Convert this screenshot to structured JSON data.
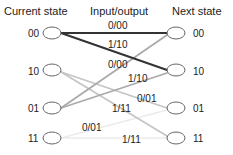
{
  "headers": {
    "current": "Current state",
    "io": "Input/output",
    "next": "Next state"
  },
  "left_states": [
    "00",
    "10",
    "01",
    "11"
  ],
  "right_states": [
    "00",
    "10",
    "01",
    "11"
  ],
  "edges": [
    {
      "from": "00",
      "to": "00",
      "label": "0/00",
      "color": "#333333"
    },
    {
      "from": "00",
      "to": "10",
      "label": "1/10",
      "color": "#333333"
    },
    {
      "from": "01",
      "to": "00",
      "label": "0/00",
      "color": "#aaaaaa"
    },
    {
      "from": "01",
      "to": "10",
      "label": "1/10",
      "color": "#aaaaaa"
    },
    {
      "from": "10",
      "to": "01",
      "label": "0/01",
      "color": "#c4c4c4"
    },
    {
      "from": "10",
      "to": "11",
      "label": "1/11",
      "color": "#c4c4c4"
    },
    {
      "from": "11",
      "to": "01",
      "label": "0/01",
      "color": "#ebebeb"
    },
    {
      "from": "11",
      "to": "11",
      "label": "1/11",
      "color": "#ebebeb"
    }
  ]
}
